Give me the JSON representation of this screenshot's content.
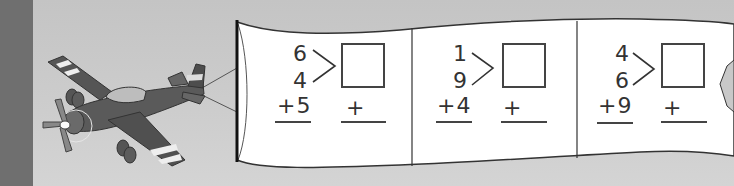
{
  "colors": {
    "background": "#c9c9c9",
    "left_strip": "#6f6f6f",
    "banner_fill": "#ffffff",
    "ink": "#333333"
  },
  "illustration": {
    "subject": "airplane-towing-banner",
    "icon": "airplane-icon"
  },
  "problems": [
    {
      "top": "6",
      "middle": "4",
      "addend": "+5",
      "answer_plus": "+"
    },
    {
      "top": "1",
      "middle": "9",
      "addend": "+4",
      "answer_plus": "+"
    },
    {
      "top": "4",
      "middle": "6",
      "addend": "+9",
      "answer_plus": "+"
    }
  ]
}
